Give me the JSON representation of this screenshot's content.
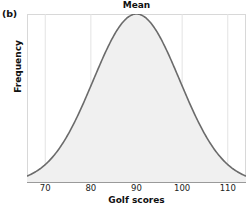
{
  "panel": {
    "label": "(b)"
  },
  "chart_data": {
    "type": "area",
    "title": "Mean",
    "xlabel": "Golf scores",
    "ylabel": "Frequency",
    "xlim": [
      66,
      114
    ],
    "ylim": [
      0,
      1
    ],
    "xticks": [
      70,
      80,
      90,
      100,
      110
    ],
    "xtick_labels": [
      "70",
      "80",
      "90",
      "100",
      "110"
    ],
    "yticks": [],
    "ytick_labels": [],
    "grid": "vertical-only",
    "legend": "none",
    "annotations": [
      "Mean"
    ],
    "distribution": {
      "shape": "normal",
      "mean": 90,
      "std": 9.5,
      "peak_x": 90,
      "peak_y": 1.0
    },
    "x": [
      66,
      68,
      70,
      72,
      74,
      76,
      78,
      80,
      82,
      84,
      86,
      88,
      90,
      92,
      94,
      96,
      98,
      100,
      102,
      104,
      106,
      108,
      110,
      112,
      114
    ],
    "values": [
      0.013,
      0.025,
      0.044,
      0.076,
      0.122,
      0.187,
      0.273,
      0.379,
      0.5,
      0.625,
      0.743,
      0.84,
      0.91,
      0.95,
      0.95,
      0.91,
      0.84,
      0.743,
      0.625,
      0.5,
      0.379,
      0.273,
      0.187,
      0.122,
      0.076
    ],
    "colors": {
      "curve_stroke": "#6b6b6b",
      "area_fill": "#f0f0f0",
      "gridline": "#e3e3e3",
      "axis": "#d8d8d8",
      "baseline": "#9a9a9a",
      "text": "#111111"
    }
  }
}
